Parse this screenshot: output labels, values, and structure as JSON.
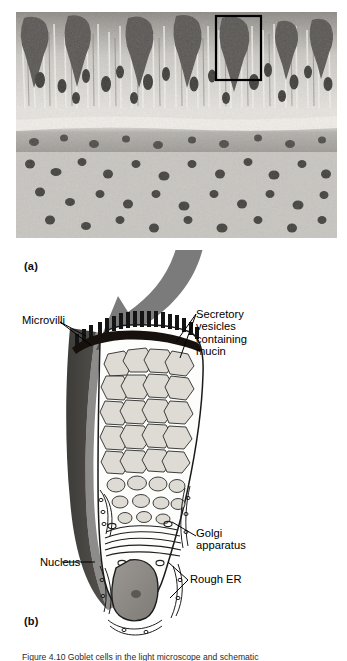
{
  "figure": {
    "panels": [
      {
        "id": "a",
        "label": "(a)",
        "kind": "light-micrograph",
        "description": "Histological section of pseudostratified ciliated columnar epithelium containing darkly stained goblet cells, with a black rectangle outlining one goblet cell"
      },
      {
        "id": "b",
        "label": "(b)",
        "kind": "line-drawing",
        "description": "Schematic drawing of a single mucous goblet cell"
      }
    ],
    "callout_arrow": {
      "name": "magnification-arrow",
      "color": "#7b7b7b",
      "from": "boxed goblet cell in micrograph",
      "to": "schematic goblet cell"
    },
    "labels": [
      {
        "id": "microvilli",
        "text": "Microvilli",
        "leader": "forked"
      },
      {
        "id": "secretory-vesicles",
        "text": "Secretory\nvesicles\ncontaining\nmucin",
        "leader": "forked"
      },
      {
        "id": "golgi",
        "text": "Golgi\napparatus",
        "leader": "single"
      },
      {
        "id": "nucleus",
        "text": "Nucleus",
        "leader": "single"
      },
      {
        "id": "rough-er",
        "text": "Rough ER",
        "leader": "forked"
      }
    ],
    "colors": {
      "ink": "#000000",
      "arrow_gray": "#7b7b7b",
      "neighbor_cell_dark": "#4a4845",
      "nucleus_fill": "#8d8a85",
      "vesicle_fill": "#dedad4",
      "page_background": "#ffffff"
    },
    "caption": "Figure 4.10   Goblet cells in the light microscope and schematic"
  }
}
